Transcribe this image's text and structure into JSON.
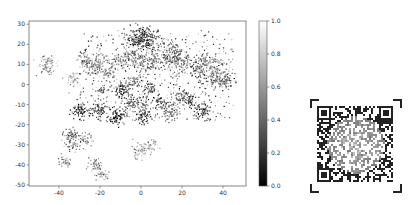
{
  "chart_data": [
    {
      "type": "scatter",
      "title": "",
      "xlabel": "",
      "ylabel": "",
      "xlim": [
        -54.6,
        51.2
      ],
      "ylim": [
        -50.5,
        31.6
      ],
      "xticks": [
        -40,
        -20,
        0,
        20,
        40
      ],
      "yticks": [
        30,
        20,
        10,
        0,
        -10,
        -20,
        -30,
        -40,
        -50
      ],
      "grid": false,
      "colormap": "gray",
      "colorbar": {
        "range": [
          0.0,
          1.0
        ],
        "ticks": [
          "0.0",
          "0.2",
          "0.4",
          "0.6",
          "0.8",
          "1.0"
        ],
        "placement": "right"
      },
      "clusters": [
        {
          "x": -46,
          "y": 10,
          "spread": 2.2,
          "n": 90,
          "value": 0.7
        },
        {
          "x": -34,
          "y": 3,
          "spread": 1.8,
          "n": 50,
          "value": 0.75
        },
        {
          "x": -27,
          "y": 12,
          "spread": 2.0,
          "n": 55,
          "value": 0.55
        },
        {
          "x": -23,
          "y": 9,
          "spread": 2.0,
          "n": 55,
          "value": 0.5
        },
        {
          "x": -20,
          "y": 12,
          "spread": 2.0,
          "n": 50,
          "value": 0.6
        },
        {
          "x": -17,
          "y": 6,
          "spread": 2.0,
          "n": 50,
          "value": 0.55
        },
        {
          "x": -12,
          "y": 11,
          "spread": 2.2,
          "n": 50,
          "value": 0.6
        },
        {
          "x": -19,
          "y": -3,
          "spread": 1.5,
          "n": 35,
          "value": 0.4
        },
        {
          "x": -9,
          "y": -3,
          "spread": 1.8,
          "n": 60,
          "value": 0.2
        },
        {
          "x": -30,
          "y": -13,
          "spread": 2.0,
          "n": 70,
          "value": 0.2
        },
        {
          "x": -20,
          "y": -13,
          "spread": 2.0,
          "n": 70,
          "value": 0.3
        },
        {
          "x": -12,
          "y": -16,
          "spread": 2.0,
          "n": 80,
          "value": 0.2
        },
        {
          "x": -34,
          "y": -25,
          "spread": 1.8,
          "n": 45,
          "value": 0.45
        },
        {
          "x": -34,
          "y": -29,
          "spread": 1.8,
          "n": 45,
          "value": 0.4
        },
        {
          "x": -27,
          "y": -28,
          "spread": 1.8,
          "n": 40,
          "value": 0.55
        },
        {
          "x": -37,
          "y": -38,
          "spread": 1.8,
          "n": 40,
          "value": 0.65
        },
        {
          "x": -22,
          "y": -40,
          "spread": 1.8,
          "n": 45,
          "value": 0.6
        },
        {
          "x": -19,
          "y": -45,
          "spread": 1.6,
          "n": 40,
          "value": 0.7
        },
        {
          "x": -1,
          "y": 23,
          "spread": 3.0,
          "n": 140,
          "value": 0.2
        },
        {
          "x": 5,
          "y": 22,
          "spread": 2.5,
          "n": 80,
          "value": 0.3
        },
        {
          "x": -5,
          "y": 13,
          "spread": 3.0,
          "n": 90,
          "value": 0.55
        },
        {
          "x": 2,
          "y": 10,
          "spread": 3.0,
          "n": 90,
          "value": 0.5
        },
        {
          "x": 10,
          "y": 13,
          "spread": 3.0,
          "n": 80,
          "value": 0.45
        },
        {
          "x": 16,
          "y": 16,
          "spread": 2.5,
          "n": 80,
          "value": 0.35
        },
        {
          "x": 20,
          "y": 10,
          "spread": 2.5,
          "n": 70,
          "value": 0.55
        },
        {
          "x": 28,
          "y": 8,
          "spread": 2.5,
          "n": 60,
          "value": 0.3
        },
        {
          "x": 33,
          "y": 10,
          "spread": 2.5,
          "n": 80,
          "value": 0.6
        },
        {
          "x": 38,
          "y": 6,
          "spread": 2.5,
          "n": 60,
          "value": 0.55
        },
        {
          "x": 42,
          "y": 2,
          "spread": 2.0,
          "n": 50,
          "value": 0.4
        },
        {
          "x": 36,
          "y": 2,
          "spread": 2.0,
          "n": 50,
          "value": 0.45
        },
        {
          "x": -4,
          "y": 1,
          "spread": 2.0,
          "n": 50,
          "value": 0.5
        },
        {
          "x": 4,
          "y": -2,
          "spread": 2.0,
          "n": 50,
          "value": 0.3
        },
        {
          "x": -6,
          "y": -9,
          "spread": 2.0,
          "n": 50,
          "value": 0.35
        },
        {
          "x": 0,
          "y": -10,
          "spread": 2.0,
          "n": 50,
          "value": 0.45
        },
        {
          "x": 1,
          "y": -16,
          "spread": 1.8,
          "n": 55,
          "value": 0.2
        },
        {
          "x": 10,
          "y": -9,
          "spread": 2.2,
          "n": 55,
          "value": 0.35
        },
        {
          "x": 15,
          "y": -13,
          "spread": 2.2,
          "n": 70,
          "value": 0.45
        },
        {
          "x": 19,
          "y": -5,
          "spread": 2.0,
          "n": 45,
          "value": 0.5
        },
        {
          "x": 24,
          "y": -8,
          "spread": 2.0,
          "n": 55,
          "value": 0.3
        },
        {
          "x": 30,
          "y": -13,
          "spread": 2.2,
          "n": 65,
          "value": 0.25
        },
        {
          "x": -1,
          "y": -33,
          "spread": 2.0,
          "n": 55,
          "value": 0.7
        },
        {
          "x": 4,
          "y": -31,
          "spread": 2.0,
          "n": 50,
          "value": 0.75
        }
      ],
      "background_scatter": {
        "xrange": [
          -30,
          45
        ],
        "yrange": [
          -18,
          27
        ],
        "n": 500
      }
    }
  ],
  "qr_code": {
    "description": "QR code image with corner brackets"
  }
}
